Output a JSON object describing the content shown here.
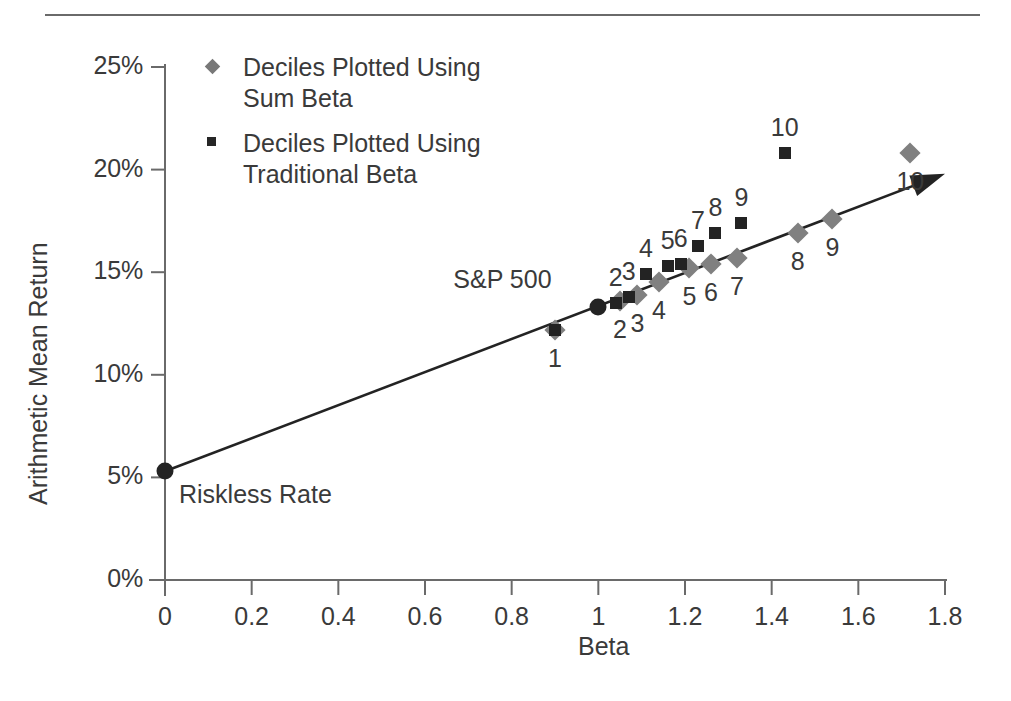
{
  "chart_data": {
    "type": "scatter",
    "title": "",
    "xlabel": "Beta",
    "ylabel": "Arithmetic Mean Return",
    "xlim": [
      0,
      1.8
    ],
    "ylim": [
      0,
      25
    ],
    "xticks": [
      "0",
      "0.2",
      "0.4",
      "0.6",
      "0.8",
      "1",
      "1.2",
      "1.4",
      "1.6",
      "1.8"
    ],
    "xtick_values": [
      0,
      0.2,
      0.4,
      0.6,
      0.8,
      1.0,
      1.2,
      1.4,
      1.6,
      1.8
    ],
    "yticks": [
      "0%",
      "5%",
      "10%",
      "15%",
      "20%",
      "25%"
    ],
    "ytick_values": [
      0,
      5,
      10,
      15,
      20,
      25
    ],
    "grid": false,
    "legend_position": "top-left",
    "legend": [
      {
        "marker": "diamond",
        "color": "#808080",
        "label": "Deciles Plotted Using\nSum Beta"
      },
      {
        "marker": "square",
        "color": "#232323",
        "label": "Deciles Plotted Using\nTraditional Beta"
      }
    ],
    "series": [
      {
        "name": "Deciles Plotted Using Sum Beta",
        "marker": "diamond",
        "color": "#808080",
        "label_position": "below",
        "points": [
          {
            "label": "1",
            "x": 0.9,
            "y": 12.2
          },
          {
            "label": "2",
            "x": 1.05,
            "y": 13.6
          },
          {
            "label": "3",
            "x": 1.09,
            "y": 13.9
          },
          {
            "label": "4",
            "x": 1.14,
            "y": 14.5
          },
          {
            "label": "5",
            "x": 1.21,
            "y": 15.2
          },
          {
            "label": "6",
            "x": 1.26,
            "y": 15.4
          },
          {
            "label": "7",
            "x": 1.32,
            "y": 15.7
          },
          {
            "label": "8",
            "x": 1.46,
            "y": 16.9
          },
          {
            "label": "9",
            "x": 1.54,
            "y": 17.6
          },
          {
            "label": "10",
            "x": 1.72,
            "y": 20.8
          }
        ]
      },
      {
        "name": "Deciles Plotted Using Traditional Beta",
        "marker": "square",
        "color": "#232323",
        "label_position": "above",
        "points": [
          {
            "label": "1",
            "x": 0.9,
            "y": 12.2
          },
          {
            "label": "2",
            "x": 1.04,
            "y": 13.5
          },
          {
            "label": "3",
            "x": 1.07,
            "y": 13.8
          },
          {
            "label": "4",
            "x": 1.11,
            "y": 14.9
          },
          {
            "label": "5",
            "x": 1.16,
            "y": 15.3
          },
          {
            "label": "6",
            "x": 1.19,
            "y": 15.4
          },
          {
            "label": "7",
            "x": 1.23,
            "y": 16.3
          },
          {
            "label": "8",
            "x": 1.27,
            "y": 16.9
          },
          {
            "label": "9",
            "x": 1.33,
            "y": 17.4
          },
          {
            "label": "10",
            "x": 1.43,
            "y": 20.8
          }
        ]
      }
    ],
    "reference_points": [
      {
        "name": "riskless-rate",
        "label": "Riskless Rate",
        "x": 0.0,
        "y": 5.3,
        "marker": "circle"
      },
      {
        "name": "sp-500",
        "label": "S&P 500",
        "x": 1.0,
        "y": 13.3,
        "marker": "circle"
      }
    ],
    "trend_line": {
      "name": "security-market-line",
      "x_start": 0.0,
      "y_start": 5.3,
      "x_end": 1.8,
      "y_end": 19.8,
      "arrow_end": true,
      "color": "#232323"
    }
  }
}
